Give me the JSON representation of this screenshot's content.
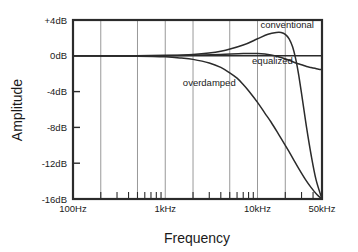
{
  "chart_data": {
    "type": "line",
    "title": "",
    "xlabel": "Frequency",
    "ylabel": "Amplitude",
    "xscale": "log",
    "xlim": [
      100,
      50000
    ],
    "ylim": [
      -16,
      4
    ],
    "grid": true,
    "legend": "inline-annotations",
    "xtick_labels": [
      "100Hz",
      "1kHz",
      "10kHz",
      "50kHz"
    ],
    "xtick_values": [
      100,
      1000,
      10000,
      50000
    ],
    "ytick_labels": [
      "+4dB",
      "0dB",
      "-4dB",
      "-8dB",
      "-12dB",
      "-16dB"
    ],
    "ytick_values": [
      4,
      0,
      -4,
      -8,
      -12,
      -16
    ],
    "gridline_values": [
      200,
      500,
      1000,
      2000,
      5000,
      10000,
      20000,
      50000
    ],
    "minor_tick_values": [
      200,
      300,
      400,
      500,
      600,
      700,
      800,
      900,
      2000,
      3000,
      4000,
      5000,
      6000,
      7000,
      8000,
      9000,
      20000,
      30000,
      40000
    ],
    "series": [
      {
        "name": "conventional",
        "label": "conventional",
        "label_x": 21000,
        "label_y": 3.1,
        "x": [
          100,
          300,
          1000,
          2000,
          4000,
          7000,
          10000,
          13000,
          16000,
          18000,
          20000,
          22000,
          24000,
          26000,
          28000,
          31000,
          34000,
          38000,
          43000,
          50000
        ],
        "y": [
          0,
          0,
          0.05,
          0.15,
          0.5,
          1.2,
          1.9,
          2.4,
          2.6,
          2.6,
          2.4,
          1.9,
          1.0,
          -0.4,
          -2.2,
          -5.2,
          -8.0,
          -11.0,
          -13.8,
          -16
        ]
      },
      {
        "name": "equalized",
        "label": "equalized",
        "label_x": 14500,
        "label_y": -0.95,
        "x": [
          100,
          500,
          1000,
          2000,
          4000,
          7000,
          10000,
          14000,
          18000,
          22000,
          26000,
          30000,
          34000,
          38000,
          42000,
          46000,
          50000
        ],
        "y": [
          0,
          0,
          0,
          0.05,
          0.15,
          0.25,
          0.25,
          0.1,
          -0.2,
          -0.5,
          -0.8,
          -1.0,
          -1.2,
          -1.3,
          -1.4,
          -1.5,
          -1.55
        ]
      },
      {
        "name": "overdamped",
        "label": "overdamped",
        "label_x": 3000,
        "label_y": -3.4,
        "x": [
          100,
          500,
          1000,
          1500,
          2000,
          3000,
          4000,
          5000,
          6000,
          7000,
          8000,
          10000,
          12000,
          14000,
          17000,
          20000,
          24000,
          28000,
          33000,
          38000,
          44000,
          50000
        ],
        "y": [
          0,
          -0.05,
          -0.12,
          -0.25,
          -0.4,
          -0.8,
          -1.3,
          -1.9,
          -2.5,
          -3.2,
          -3.9,
          -5.2,
          -6.4,
          -7.4,
          -8.8,
          -10.0,
          -11.4,
          -12.6,
          -13.8,
          -14.7,
          -15.5,
          -16
        ]
      }
    ]
  }
}
